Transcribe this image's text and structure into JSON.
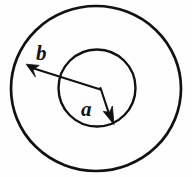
{
  "figure": {
    "background_color": "#fefefe",
    "stroke_color": "#111111",
    "width": 192,
    "height": 177
  },
  "shapes": {
    "outer_circle": {
      "name": "outer-circle",
      "cx": 96,
      "cy": 88.5,
      "r": 84.5,
      "stroke_width": 2.6
    },
    "inner_circle": {
      "name": "inner-circle",
      "cx": 97,
      "cy": 88,
      "r": 38.5,
      "stroke_width": 2.4
    }
  },
  "annotations": {
    "vertex": {
      "x": 100,
      "y": 88.5
    },
    "outer_radius": {
      "label": "b",
      "label_x": 36,
      "label_y": 60,
      "font_size": 21,
      "line_from_x": 100,
      "line_from_y": 88.5,
      "line_to_x": 31.5,
      "line_to_y": 67.5,
      "arrow_tip_x": 26.5,
      "arrow_tip_y": 64.5
    },
    "inner_radius": {
      "label": "a",
      "label_x": 81,
      "label_y": 116,
      "font_size": 21,
      "line_from_x": 100,
      "line_from_y": 88.5,
      "line_to_x": 109,
      "line_to_y": 114,
      "arrow_tip_x": 113,
      "arrow_tip_y": 124
    }
  }
}
